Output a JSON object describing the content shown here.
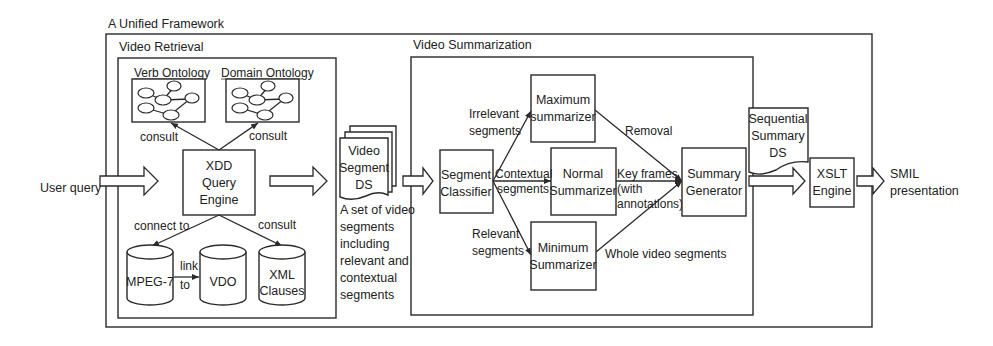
{
  "frames": {
    "outer": "A Unified Framework",
    "retrieval": "Video Retrieval",
    "summarization": "Video Summarization"
  },
  "input": {
    "label": "User query"
  },
  "ontologies": [
    {
      "title": "Verb Ontology",
      "edge_label": "consult"
    },
    {
      "title": "Domain Ontology",
      "edge_label": "consult"
    }
  ],
  "query_engine": {
    "lines": [
      "XDD",
      "Query",
      "Engine"
    ]
  },
  "engine_edges": {
    "connect": "connect to",
    "consult": "consult"
  },
  "databases": [
    {
      "lines": [
        "MPEG-7"
      ]
    },
    {
      "lines": [
        "VDO"
      ]
    },
    {
      "lines": [
        "XML",
        "Clauses"
      ]
    }
  ],
  "link_label": {
    "line1": "link",
    "line2": "to"
  },
  "segment_ds": {
    "lines": [
      "Video",
      "Segment",
      "DS"
    ],
    "caption": [
      "A set of video",
      "segments",
      "including",
      "relevant and",
      "contextual",
      "segments"
    ]
  },
  "classifier": {
    "lines": [
      "Segment",
      "Classifier"
    ]
  },
  "summarizers": {
    "maximum": {
      "lines": [
        "Maximum",
        "summarizer"
      ]
    },
    "normal": {
      "lines": [
        "Normal",
        "Summarizer"
      ]
    },
    "minimum": {
      "lines": [
        "Minimum",
        "Summarizer"
      ]
    }
  },
  "classifier_edges": {
    "irrelevant": [
      "Irrelevant",
      "segments"
    ],
    "contextual": [
      "Contextual",
      "segments"
    ],
    "relevant": [
      "Relevant",
      "segments"
    ]
  },
  "summarizer_edges": {
    "removal": "Removal",
    "keyframes": [
      "Key frames",
      "(with",
      "annotations)"
    ],
    "whole": "Whole video segments"
  },
  "generator": {
    "lines": [
      "Summary",
      "Generator"
    ]
  },
  "sequential_ds": {
    "lines": [
      "Sequential",
      "Summary",
      "DS"
    ]
  },
  "xslt": {
    "lines": [
      "XSLT",
      "Engine"
    ]
  },
  "output": {
    "lines": [
      "SMIL",
      "presentation"
    ]
  }
}
